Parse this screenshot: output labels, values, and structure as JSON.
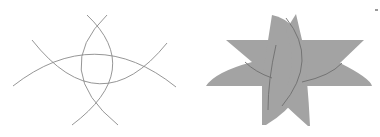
{
  "figures": [
    {
      "id": "outline",
      "description": "Four intersecting circular arcs drawn as thin gray lines",
      "stroke_color": "#8a8a8a",
      "fill_color": "none",
      "arcs": [
        {
          "name": "upper-horizontal-arc",
          "path": "M13,86 Q95,22 176,87"
        },
        {
          "name": "lower-bowl-arc",
          "path": "M32,40 Q100,126 167,43"
        },
        {
          "name": "left-vertical-arc",
          "path": "M107,15 Q50,70 118,125"
        },
        {
          "name": "right-vertical-arc",
          "path": "M87,15 Q145,70 72,125"
        }
      ]
    },
    {
      "id": "filled",
      "description": "Same arc arrangement filled to form a gray star-like shape",
      "stroke_color": "#6e6e6e",
      "fill_color": "#a3a3a3"
    }
  ],
  "corner_mark": {
    "color": "#9a9a9a"
  }
}
